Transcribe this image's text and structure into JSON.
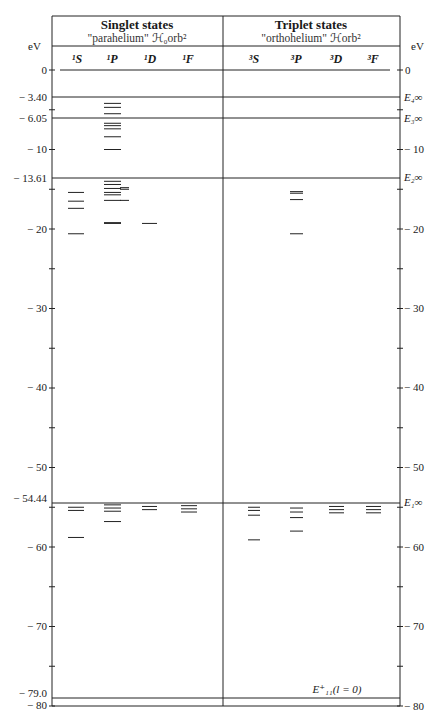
{
  "header": {
    "singlet_title": "Singlet states",
    "singlet_sub": "\"parahelium\" ℋ₀orb²",
    "triplet_title": "Triplet states",
    "triplet_sub": "\"orthohelium\" ℋorb²",
    "unit_left": "eV",
    "unit_right": "eV"
  },
  "columns": {
    "singlet": [
      "¹S",
      "¹P",
      "¹D",
      "¹F"
    ],
    "triplet": [
      "³S",
      "³P",
      "³D",
      "³F"
    ]
  },
  "left_axis_labels": [
    "0",
    "− 3.40",
    "− 6.05",
    "− 10",
    "− 13.61",
    "− 20",
    "− 30",
    "− 40",
    "− 50",
    "− 54.44",
    "− 60",
    "− 70",
    "− 79.0",
    "− 80"
  ],
  "right_axis_labels": [
    "0",
    "E₄∞",
    "E₃∞",
    "− 10",
    "E₂∞",
    "− 20",
    "− 30",
    "− 40",
    "− 50",
    "E₁∞",
    "− 60",
    "− 70",
    "− 80"
  ],
  "ground_label": "E⁺₁₁(l = 0)",
  "chart_data": {
    "type": "energy-level-diagram",
    "ylabel": "eV",
    "ylim": [
      -80,
      0
    ],
    "y_ticks": [
      0,
      -10,
      -20,
      -30,
      -40,
      -50,
      -60,
      -70,
      -80
    ],
    "thresholds": [
      {
        "label": "0",
        "value": 0
      },
      {
        "label": "E4∞",
        "value": -3.4
      },
      {
        "label": "E3∞",
        "value": -6.05
      },
      {
        "label": "E2∞",
        "value": -13.61
      },
      {
        "label": "E1∞",
        "value": -54.44
      },
      {
        "label": "E+11 (l=0)",
        "value": -79.0
      }
    ],
    "levels": {
      "1S": [
        -15.4,
        -16.5,
        -17.4,
        -20.6,
        -55.0,
        -55.4,
        -58.8
      ],
      "1P": [
        -4.2,
        -4.7,
        -5.5,
        -6.7,
        -7.0,
        -7.4,
        -8.4,
        -10.0,
        -14.0,
        -14.4,
        -14.9,
        -15.4,
        -15.7,
        -16.4,
        -19.2,
        -19.3,
        -54.7,
        -55.1,
        -55.5,
        -56.8
      ],
      "1P_b": [
        -14.8,
        -15.0,
        -16.4
      ],
      "1D": [
        -19.3,
        -54.9,
        -55.3
      ],
      "1F": [
        -54.8,
        -55.2,
        -55.6
      ],
      "3S": [
        -55.0,
        -55.4,
        -56.0,
        -59.1
      ],
      "3P": [
        -15.3,
        -15.5,
        -16.3,
        -20.6,
        -55.1,
        -55.6,
        -56.3,
        -58.0
      ],
      "3D": [
        -54.9,
        -55.3,
        -55.7
      ],
      "3F": [
        -54.9,
        -55.3,
        -55.7
      ]
    }
  }
}
